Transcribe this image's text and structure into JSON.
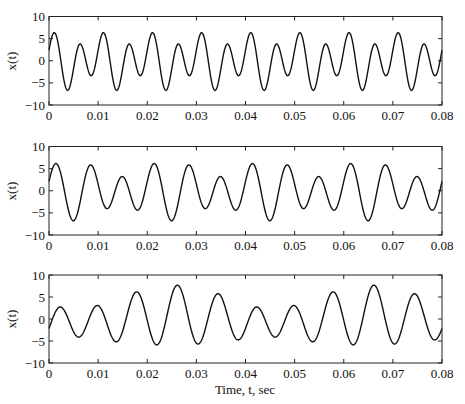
{
  "figure": {
    "xlabel": "Time, t, sec",
    "ylabel": "x(t)"
  },
  "chart_data": [
    {
      "type": "line",
      "panel": "top",
      "title": "",
      "xlabel": "",
      "ylabel": "x(t)",
      "xlim": [
        0,
        0.08
      ],
      "ylim": [
        -10,
        10
      ],
      "xticks": [
        0,
        0.01,
        0.02,
        0.03,
        0.04,
        0.05,
        0.06,
        0.07,
        0.08
      ],
      "xtick_labels": [
        "0",
        "0.01",
        "0.02",
        "0.03",
        "0.04",
        "0.05",
        "0.06",
        "0.07",
        "0.08"
      ],
      "yticks": [
        -10,
        -5,
        0,
        5,
        10
      ],
      "ytick_labels": [
        "−10",
        "−5",
        "0",
        "5",
        "10"
      ],
      "grid": false,
      "legend": null,
      "model": {
        "description": "sum of sinusoids, dominant ~200 Hz with ~100 Hz modulation",
        "components": [
          {
            "amp": 5.0,
            "freq": 200,
            "t_peak": 0.0012
          },
          {
            "amp": 2.1,
            "freq": 100,
            "t_peak": -0.00025
          }
        ]
      },
      "series": [
        {
          "name": "x(t)",
          "peaks_t": [
            0.0012,
            0.0065,
            0.0112,
            0.0165,
            0.0212,
            0.0265,
            0.0312,
            0.0365,
            0.0412,
            0.0465,
            0.0512,
            0.0565,
            0.0612,
            0.0665,
            0.0712,
            0.0765
          ],
          "peaks_x": [
            6.5,
            3.5,
            6.5,
            3.5,
            6.5,
            3.5,
            6.5,
            3.5,
            6.5,
            3.5,
            6.5,
            3.5,
            6.5,
            3.5,
            6.5,
            3.5
          ],
          "troughs_t": [
            0.004,
            0.0088,
            0.014,
            0.0188,
            0.024,
            0.0288,
            0.034,
            0.0388,
            0.044,
            0.0488,
            0.054,
            0.0588,
            0.064,
            0.0688,
            0.074,
            0.0788
          ],
          "troughs_x": [
            -6.5,
            -3.5,
            -6.5,
            -3.5,
            -6.5,
            -3.5,
            -6.5,
            -3.5,
            -6.5,
            -3.5,
            -6.5,
            -3.5,
            -6.5,
            -3.5,
            -6.5,
            -3.5
          ]
        }
      ]
    },
    {
      "type": "line",
      "panel": "middle",
      "title": "",
      "xlabel": "",
      "ylabel": "x(t)",
      "xlim": [
        0,
        0.08
      ],
      "ylim": [
        -10,
        10
      ],
      "xticks": [
        0,
        0.01,
        0.02,
        0.03,
        0.04,
        0.05,
        0.06,
        0.07,
        0.08
      ],
      "xtick_labels": [
        "0",
        "0.01",
        "0.02",
        "0.03",
        "0.04",
        "0.05",
        "0.06",
        "0.07",
        "0.08"
      ],
      "yticks": [
        -10,
        -5,
        0,
        5,
        10
      ],
      "ytick_labels": [
        "−10",
        "−5",
        "0",
        "5",
        "10"
      ],
      "grid": false,
      "legend": null,
      "model": {
        "description": "sum of sinusoids, dominant ~150 Hz with ~100 Hz component (pattern repeats every 0.02 s)",
        "components": [
          {
            "amp": 5.0,
            "freq": 150,
            "t_peak": 0.0016
          },
          {
            "amp": 1.8,
            "freq": 100,
            "t_peak": 0.0101
          }
        ]
      },
      "series": [
        {
          "name": "x(t)",
          "peaks_t": [
            0.0016,
            0.0088,
            0.0151,
            0.0213,
            0.0284,
            0.0352,
            0.0416,
            0.0484,
            0.0551,
            0.0616,
            0.0684,
            0.0751
          ],
          "peaks_x": [
            6.2,
            6.2,
            3.0,
            6.2,
            6.2,
            3.0,
            6.2,
            6.2,
            3.0,
            6.2,
            6.2,
            3.0
          ],
          "troughs_t": [
            0.0051,
            0.0121,
            0.0183,
            0.0251,
            0.0321,
            0.0383,
            0.0451,
            0.0521,
            0.0583,
            0.0651,
            0.0721,
            0.0783
          ],
          "troughs_x": [
            -7.0,
            -4.0,
            -4.0,
            -7.0,
            -4.0,
            -4.0,
            -7.0,
            -4.0,
            -4.0,
            -7.0,
            -4.0,
            -4.0
          ]
        }
      ]
    },
    {
      "type": "line",
      "panel": "bottom",
      "title": "",
      "xlabel": "Time, t, sec",
      "ylabel": "x(t)",
      "xlim": [
        0,
        0.08
      ],
      "ylim": [
        -10,
        10
      ],
      "xticks": [
        0,
        0.01,
        0.02,
        0.03,
        0.04,
        0.05,
        0.06,
        0.07,
        0.08
      ],
      "xtick_labels": [
        "0",
        "0.01",
        "0.02",
        "0.03",
        "0.04",
        "0.05",
        "0.06",
        "0.07",
        "0.08"
      ],
      "yticks": [
        -10,
        -5,
        0,
        5,
        10
      ],
      "ytick_labels": [
        "−10",
        "−5",
        "0",
        "5",
        "10"
      ],
      "grid": false,
      "legend": null,
      "model": {
        "description": "sum of sinusoids, dominant ~125 Hz with ~100 Hz component (pattern repeats every 0.04 s)",
        "components": [
          {
            "amp": 5.0,
            "freq": 125,
            "t_peak": 0.0021
          },
          {
            "amp": 1.8,
            "freq": 100,
            "t_peak": 0.0063
          },
          {
            "amp": 0.9,
            "freq": 25,
            "t_peak": 0.026
          }
        ]
      },
      "series": [
        {
          "name": "x(t)",
          "peaks_t": [
            0.0021,
            0.0105,
            0.018,
            0.0263,
            0.0342,
            0.0421,
            0.0505,
            0.058,
            0.0663,
            0.0742
          ],
          "peaks_x": [
            6.3,
            5.2,
            4.0,
            7.0,
            3.5,
            6.3,
            5.2,
            4.0,
            7.0,
            3.5
          ],
          "troughs_t": [
            0.0065,
            0.0146,
            0.022,
            0.0303,
            0.0382,
            0.0465,
            0.0546,
            0.062,
            0.0703,
            0.0782
          ],
          "troughs_x": [
            -7.0,
            -3.0,
            -6.0,
            -5.0,
            -3.5,
            -7.0,
            -3.0,
            -6.0,
            -5.0,
            -3.5
          ]
        }
      ]
    }
  ]
}
